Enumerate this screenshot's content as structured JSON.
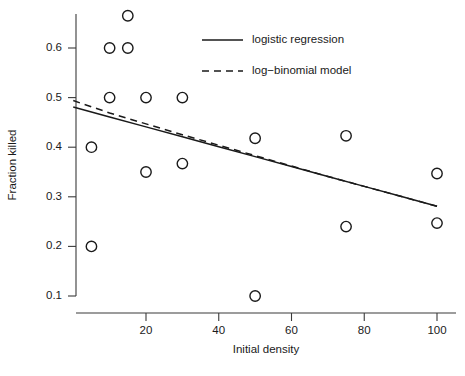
{
  "chart_data": {
    "type": "scatter",
    "title": "",
    "xlabel": "Initial density",
    "ylabel": "Fraction killed",
    "xlim": [
      0,
      105
    ],
    "ylim": [
      0.06,
      0.7
    ],
    "grid": false,
    "legend_position": "top-right",
    "x_ticks": [
      20,
      40,
      60,
      80,
      100
    ],
    "x_tick_labels": [
      "20",
      "40",
      "60",
      "80",
      "100"
    ],
    "y_ticks": [
      0.1,
      0.2,
      0.3,
      0.4,
      0.5,
      0.6
    ],
    "y_tick_labels": [
      "0.1",
      "0.2",
      "0.3",
      "0.4",
      "0.5",
      "0.6"
    ],
    "points": [
      {
        "x": 5,
        "y": 0.4
      },
      {
        "x": 5,
        "y": 0.2
      },
      {
        "x": 10,
        "y": 0.6
      },
      {
        "x": 10,
        "y": 0.5
      },
      {
        "x": 15,
        "y": 0.665
      },
      {
        "x": 15,
        "y": 0.6
      },
      {
        "x": 20,
        "y": 0.5
      },
      {
        "x": 20,
        "y": 0.35
      },
      {
        "x": 30,
        "y": 0.5
      },
      {
        "x": 30,
        "y": 0.367
      },
      {
        "x": 50,
        "y": 0.418
      },
      {
        "x": 50,
        "y": 0.1
      },
      {
        "x": 75,
        "y": 0.423
      },
      {
        "x": 75,
        "y": 0.24
      },
      {
        "x": 100,
        "y": 0.347
      },
      {
        "x": 100,
        "y": 0.247
      }
    ],
    "series": [
      {
        "name": "logistic regression",
        "style": "solid",
        "x": [
          0,
          10,
          20,
          30,
          40,
          50,
          60,
          70,
          80,
          90,
          100
        ],
        "values": [
          0.481,
          0.461,
          0.441,
          0.421,
          0.401,
          0.381,
          0.361,
          0.341,
          0.321,
          0.301,
          0.281
        ]
      },
      {
        "name": "log-binomial model",
        "style": "dashed",
        "x": [
          0,
          10,
          20,
          30,
          40,
          50,
          60,
          70,
          80,
          90,
          100
        ],
        "values": [
          0.494,
          0.469,
          0.447,
          0.425,
          0.404,
          0.383,
          0.362,
          0.341,
          0.321,
          0.301,
          0.281
        ]
      }
    ]
  },
  "legend": {
    "entries": [
      {
        "label": "logistic regression",
        "style": "solid"
      },
      {
        "label": "log−binomial model",
        "style": "dashed"
      }
    ]
  },
  "colors": {
    "ink": "#1a1a1a",
    "axis": "#3a3a3a",
    "background": "#ffffff"
  }
}
